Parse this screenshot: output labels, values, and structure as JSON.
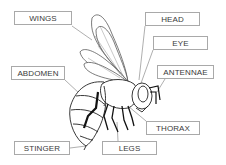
{
  "diagram": {
    "labels": [
      {
        "id": "wings",
        "text": "WINGS",
        "x": 14,
        "y": 11,
        "w": 58
      },
      {
        "id": "head",
        "text": "HEAD",
        "x": 145,
        "y": 12,
        "w": 55
      },
      {
        "id": "eye",
        "text": "EYE",
        "x": 153,
        "y": 36,
        "w": 55
      },
      {
        "id": "antennae",
        "text": "ANTENNAE",
        "x": 157,
        "y": 65,
        "w": 57
      },
      {
        "id": "abdomen",
        "text": "ABDOMEN",
        "x": 11,
        "y": 66,
        "w": 54
      },
      {
        "id": "thorax",
        "text": "THORAX",
        "x": 146,
        "y": 121,
        "w": 54
      },
      {
        "id": "stinger",
        "text": "STINGER",
        "x": 14,
        "y": 141,
        "w": 56
      },
      {
        "id": "legs",
        "text": "LEGS",
        "x": 102,
        "y": 141,
        "w": 55
      }
    ],
    "colors": {
      "line": "#333333",
      "leader": "#9a9a9a",
      "box_border": "#a9a9a9",
      "text": "#3a3a3a"
    }
  }
}
